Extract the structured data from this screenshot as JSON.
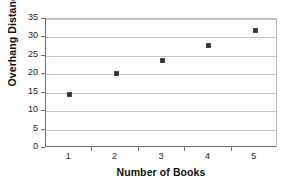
{
  "chart_data": {
    "type": "scatter",
    "title": "",
    "xlabel": "Number of Books",
    "ylabel": "Overhang Distance (cm)",
    "categories": [
      "1",
      "2",
      "3",
      "4",
      "5"
    ],
    "x": [
      1,
      2,
      3,
      4,
      5
    ],
    "values": [
      14.7,
      20.3,
      24,
      28,
      32
    ],
    "series": [
      {
        "name": "Overhang Distance",
        "values": [
          14.7,
          20.3,
          24,
          28,
          32
        ]
      }
    ],
    "points": [
      {
        "x": 1,
        "y": 14.7
      },
      {
        "x": 2,
        "y": 20.3
      },
      {
        "x": 3,
        "y": 24
      },
      {
        "x": 4,
        "y": 28
      },
      {
        "x": 5,
        "y": 32
      }
    ],
    "ylim": [
      0,
      35
    ],
    "ytick_labels": [
      "0",
      "5",
      "10",
      "15",
      "20",
      "25",
      "30",
      "35"
    ],
    "ytick_values": [
      0,
      5,
      10,
      15,
      20,
      25,
      30,
      35
    ],
    "xtick_labels": [
      "1",
      "2",
      "3",
      "4",
      "5"
    ],
    "grid": "horizontal",
    "legend": "none",
    "marker_color": "#303030",
    "gridline_color": "#c4c4c4",
    "axis_color": "#6e6e6e",
    "background_color": "#ffffff"
  }
}
